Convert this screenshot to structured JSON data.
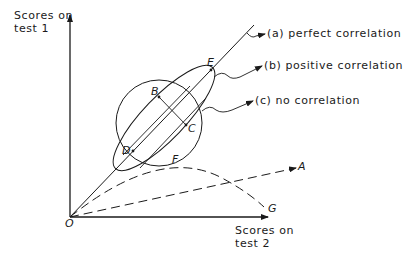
{
  "axes": {
    "y_label_line1": "Scores on",
    "y_label_line2": "test 1",
    "x_label_line1": "Scores on",
    "x_label_line2": "test 2"
  },
  "points": {
    "origin": "O",
    "B": "B",
    "C": "C",
    "D": "D",
    "E": "E",
    "F": "F",
    "A": "A",
    "G": "G"
  },
  "annotations": {
    "a": "(a) perfect correlation",
    "b": "(b) positive correlation",
    "c": "(c) no correlation"
  },
  "colors": {
    "ink": "#1a1a1a",
    "background": "#ffffff"
  }
}
